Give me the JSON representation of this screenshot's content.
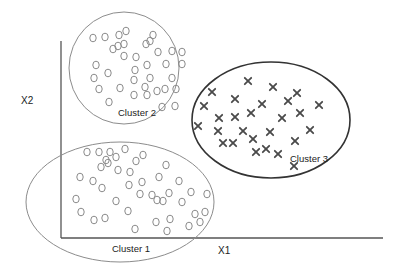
{
  "axes": {
    "x_label": "X1",
    "y_label": "X2",
    "x_axis": {
      "x1": 61,
      "y1": 238,
      "x2": 383,
      "y2": 238
    },
    "y_axis": {
      "x1": 61,
      "y1": 41,
      "x2": 61,
      "y2": 238
    }
  },
  "colors": {
    "axis": "#555555",
    "light_boundary": "#8c8c8c",
    "dark_boundary": "#333333",
    "circle_marker": "#8a8a8a",
    "x_marker": "#4a4a4a"
  },
  "clusters": [
    {
      "id": "cluster-1",
      "label": "Cluster 1",
      "marker": "circle",
      "boundary": {
        "cx": 120,
        "cy": 202,
        "rx": 94,
        "ry": 60,
        "style": "light"
      },
      "label_pos": {
        "x": 112,
        "y": 252
      },
      "points": [
        [
          87,
          152
        ],
        [
          99,
          152
        ],
        [
          110,
          152
        ],
        [
          125,
          149
        ],
        [
          116,
          157
        ],
        [
          108,
          163
        ],
        [
          101,
          167
        ],
        [
          106,
          160
        ],
        [
          118,
          170
        ],
        [
          130,
          172
        ],
        [
          136,
          161
        ],
        [
          143,
          155
        ],
        [
          166,
          165
        ],
        [
          80,
          177
        ],
        [
          93,
          181
        ],
        [
          102,
          188
        ],
        [
          129,
          185
        ],
        [
          142,
          182
        ],
        [
          159,
          177
        ],
        [
          179,
          181
        ],
        [
          191,
          192
        ],
        [
          207,
          194
        ],
        [
          140,
          194
        ],
        [
          152,
          195
        ],
        [
          169,
          193
        ],
        [
          157,
          200
        ],
        [
          163,
          201
        ],
        [
          182,
          202
        ],
        [
          116,
          201
        ],
        [
          76,
          199
        ],
        [
          81,
          212
        ],
        [
          94,
          220
        ],
        [
          105,
          218
        ],
        [
          128,
          211
        ],
        [
          195,
          214
        ],
        [
          205,
          212
        ],
        [
          135,
          229
        ],
        [
          156,
          222
        ],
        [
          170,
          219
        ],
        [
          189,
          226
        ],
        [
          200,
          222
        ],
        [
          167,
          231
        ]
      ]
    },
    {
      "id": "cluster-2",
      "label": "Cluster 2",
      "marker": "circle",
      "boundary": {
        "cx": 124,
        "cy": 68,
        "rx": 55,
        "ry": 56,
        "style": "light"
      },
      "label_pos": {
        "x": 118,
        "y": 116
      },
      "points": [
        [
          93,
          38
        ],
        [
          105,
          37
        ],
        [
          119,
          35
        ],
        [
          126,
          31
        ],
        [
          153,
          35
        ],
        [
          118,
          46
        ],
        [
          113,
          49
        ],
        [
          124,
          44
        ],
        [
          146,
          44
        ],
        [
          150,
          41
        ],
        [
          124,
          56
        ],
        [
          136,
          57
        ],
        [
          158,
          52
        ],
        [
          172,
          51
        ],
        [
          182,
          52
        ],
        [
          96,
          65
        ],
        [
          108,
          73
        ],
        [
          135,
          70
        ],
        [
          147,
          65
        ],
        [
          166,
          64
        ],
        [
          182,
          64
        ],
        [
          94,
          78
        ],
        [
          134,
          80
        ],
        [
          150,
          78
        ],
        [
          172,
          78
        ],
        [
          99,
          89
        ],
        [
          120,
          88
        ],
        [
          145,
          87
        ],
        [
          157,
          91
        ],
        [
          165,
          89
        ],
        [
          176,
          89
        ],
        [
          109,
          102
        ],
        [
          134,
          95
        ],
        [
          147,
          95
        ],
        [
          162,
          107
        ],
        [
          175,
          106
        ]
      ]
    },
    {
      "id": "cluster-3",
      "label": "Cluster 3",
      "marker": "x",
      "boundary": {
        "cx": 271,
        "cy": 120,
        "rx": 79,
        "ry": 58,
        "style": "dark"
      },
      "label_pos": {
        "x": 290,
        "y": 162
      },
      "points": [
        [
          248,
          81
        ],
        [
          212,
          92
        ],
        [
          273,
          87
        ],
        [
          297,
          93
        ],
        [
          204,
          106
        ],
        [
          235,
          99
        ],
        [
          262,
          104
        ],
        [
          288,
          101
        ],
        [
          319,
          105
        ],
        [
          219,
          118
        ],
        [
          235,
          117
        ],
        [
          251,
          113
        ],
        [
          282,
          118
        ],
        [
          300,
          113
        ],
        [
          198,
          126
        ],
        [
          218,
          131
        ],
        [
          243,
          131
        ],
        [
          270,
          132
        ],
        [
          310,
          130
        ],
        [
          223,
          143
        ],
        [
          233,
          143
        ],
        [
          253,
          139
        ],
        [
          295,
          141
        ],
        [
          256,
          152
        ],
        [
          266,
          149
        ],
        [
          278,
          154
        ],
        [
          294,
          166
        ]
      ]
    }
  ]
}
